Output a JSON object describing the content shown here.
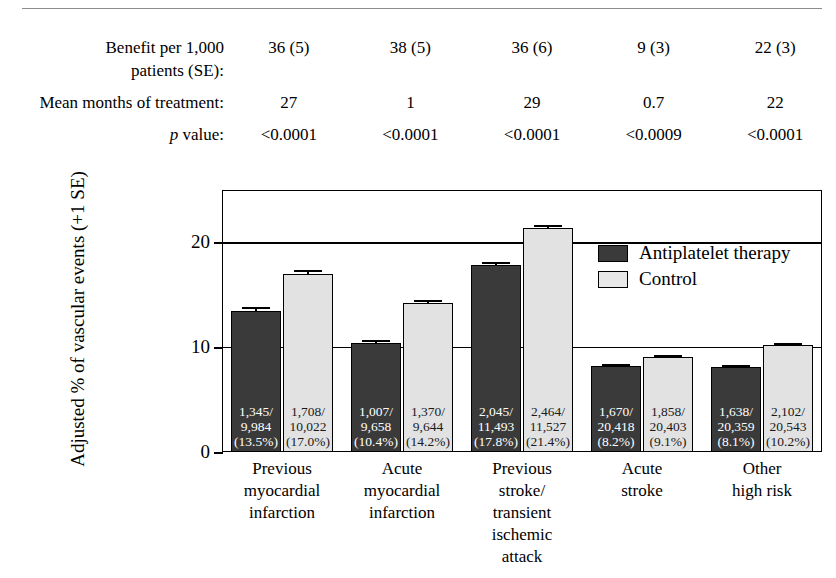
{
  "header": {
    "rows": [
      {
        "label": "Benefit per 1,000\npatients (SE):",
        "values": [
          "36 (5)",
          "38 (5)",
          "36 (6)",
          "9 (3)",
          "22 (3)"
        ]
      },
      {
        "label": "Mean months of treatment:",
        "values": [
          "27",
          "1",
          "29",
          "0.7",
          "22"
        ]
      },
      {
        "label": "p value:",
        "values": [
          "<0.0001",
          "<0.0001",
          "<0.0001",
          "<0.0009",
          "<0.0001"
        ]
      }
    ]
  },
  "legend": {
    "items": [
      {
        "label": "Antiplatelet therapy",
        "color": "#3a3a3a"
      },
      {
        "label": "Control",
        "color": "#e8e8e8"
      }
    ]
  },
  "axis": {
    "y_title": "Adjusted % of vascular events (+1 SE)",
    "y_ticks": [
      "0",
      "10",
      "20"
    ]
  },
  "chart_data": {
    "type": "bar",
    "title": "",
    "xlabel": "",
    "ylabel": "Adjusted % of vascular events (+1 SE)",
    "ylim": [
      0,
      25
    ],
    "yticks": [
      0,
      10,
      20
    ],
    "grid": true,
    "legend_position": "inside-top-right",
    "categories": [
      "Previous\nmyocardial\ninfarction",
      "Acute\nmyocardial\ninfarction",
      "Previous\nstroke/\ntransient\nischemic\nattack",
      "Acute\nstroke",
      "Other\nhigh risk"
    ],
    "series": [
      {
        "name": "Antiplatelet therapy",
        "color": "#3a3a3a",
        "values": [
          13.5,
          10.4,
          17.8,
          8.2,
          8.1
        ],
        "errors": [
          0.35,
          0.32,
          0.35,
          0.2,
          0.2
        ],
        "cell_labels": [
          "1,345/\n9,984\n(13.5%)",
          "1,007/\n9,658\n(10.4%)",
          "2,045/\n11,493\n(17.8%)",
          "1,670/\n20,418\n(8.2%)",
          "1,638/\n20,359\n(8.1%)"
        ],
        "events": [
          1345,
          1007,
          2045,
          1670,
          1638
        ],
        "totals": [
          9984,
          9658,
          11493,
          20418,
          20359
        ]
      },
      {
        "name": "Control",
        "color": "#e2e2e2",
        "values": [
          17.0,
          14.2,
          21.4,
          9.1,
          10.2
        ],
        "errors": [
          0.35,
          0.35,
          0.3,
          0.2,
          0.22
        ],
        "cell_labels": [
          "1,708/\n10,022\n(17.0%)",
          "1,370/\n9,644\n(14.2%)",
          "2,464/\n11,527\n(21.4%)",
          "1,858/\n20,403\n(9.1%)",
          "2,102/\n20,543\n(10.2%)"
        ],
        "events": [
          1708,
          1370,
          2464,
          1858,
          2102
        ],
        "totals": [
          10022,
          9644,
          11527,
          20403,
          20543
        ]
      }
    ],
    "annotations": {
      "benefit_per_1000_patients_se": [
        "36 (5)",
        "38 (5)",
        "36 (6)",
        "9 (3)",
        "22 (3)"
      ],
      "mean_months_of_treatment": [
        "27",
        "1",
        "29",
        "0.7",
        "22"
      ],
      "p_value": [
        "<0.0001",
        "<0.0001",
        "<0.0001",
        "<0.0009",
        "<0.0001"
      ]
    }
  }
}
